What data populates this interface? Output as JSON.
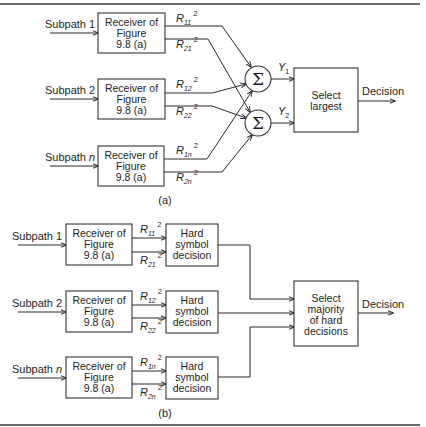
{
  "figure": {
    "part_a": {
      "caption": "(a)",
      "inputs": [
        {
          "label": "Subpath",
          "index": "1",
          "index_italic": false
        },
        {
          "label": "Subpath",
          "index": "2",
          "index_italic": false
        },
        {
          "label": "Subpath",
          "index": "n",
          "index_italic": true
        }
      ],
      "receiver_box": {
        "line1": "Receiver of",
        "line2": "Figure",
        "line3": "9.8 (a)"
      },
      "outputs": [
        {
          "top": {
            "R": "R",
            "sub": "11",
            "sup": "2"
          },
          "bottom": {
            "R": "R",
            "sub": "21",
            "sup": "2"
          }
        },
        {
          "top": {
            "R": "R",
            "sub": "12",
            "sup": "2"
          },
          "bottom": {
            "R": "R",
            "sub": "22",
            "sup": "2"
          }
        },
        {
          "top": {
            "R": "R",
            "sub": "1n",
            "sup": "2"
          },
          "bottom": {
            "R": "R",
            "sub": "2n",
            "sup": "2"
          }
        }
      ],
      "summers": [
        {
          "symbol": "Σ",
          "output": "Y",
          "output_sub": "1"
        },
        {
          "symbol": "Σ",
          "output": "Y",
          "output_sub": "2"
        }
      ],
      "select_box": {
        "line1": "Select",
        "line2": "largest"
      },
      "decision_label": "Decision"
    },
    "part_b": {
      "caption": "(b)",
      "inputs": [
        {
          "label": "Subpath",
          "index": "1",
          "index_italic": false
        },
        {
          "label": "Subpath",
          "index": "2",
          "index_italic": false
        },
        {
          "label": "Subpath",
          "index": "n",
          "index_italic": true
        }
      ],
      "receiver_box": {
        "line1": "Receiver of",
        "line2": "Figure",
        "line3": "9.8 (a)"
      },
      "outputs": [
        {
          "top": {
            "R": "R",
            "sub": "11",
            "sup": "2"
          },
          "bottom": {
            "R": "R",
            "sub": "21",
            "sup": "2"
          }
        },
        {
          "top": {
            "R": "R",
            "sub": "12",
            "sup": "2"
          },
          "bottom": {
            "R": "R",
            "sub": "22",
            "sup": "2"
          }
        },
        {
          "top": {
            "R": "R",
            "sub": "1n",
            "sup": "2"
          },
          "bottom": {
            "R": "R",
            "sub": "2n",
            "sup": "2"
          }
        }
      ],
      "hard_box": {
        "line1": "Hard",
        "line2": "symbol",
        "line3": "decision"
      },
      "majority_box": {
        "line1": "Select",
        "line2": "majority",
        "line3": "of hard",
        "line4": "decisions"
      },
      "decision_label": "Decision"
    }
  }
}
